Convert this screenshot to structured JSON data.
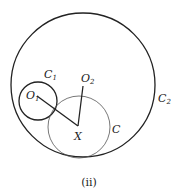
{
  "diagram": {
    "caption": "(ii)",
    "labels": {
      "C1": "C",
      "C1_sub": "1",
      "C2": "C",
      "C2_sub": "2",
      "C": "C",
      "O1": "O",
      "O1_sub": "1",
      "O2": "O",
      "O2_sub": "2",
      "X": "X"
    },
    "colors": {
      "stroke": "#222222",
      "thin_stroke": "#555555",
      "background": "#ffffff"
    }
  }
}
